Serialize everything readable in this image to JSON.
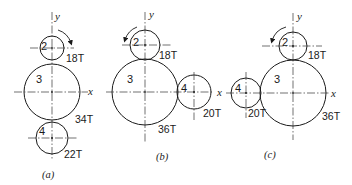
{
  "diagram": {
    "type": "gear-train-configurations",
    "axis_labels": {
      "x": "x",
      "y": "y"
    },
    "panels": [
      {
        "caption": "(a)",
        "rotation": "clockwise",
        "gears": [
          {
            "id": "2",
            "teeth": "18T"
          },
          {
            "id": "3",
            "teeth": "34T"
          },
          {
            "id": "4",
            "teeth": "22T"
          }
        ]
      },
      {
        "caption": "(b)",
        "rotation": "counterclockwise",
        "gears": [
          {
            "id": "2",
            "teeth": "18T"
          },
          {
            "id": "3",
            "teeth": "36T"
          },
          {
            "id": "4",
            "teeth": "20T"
          }
        ]
      },
      {
        "caption": "(c)",
        "rotation": "counterclockwise",
        "gears": [
          {
            "id": "2",
            "teeth": "18T"
          },
          {
            "id": "3",
            "teeth": "36T"
          },
          {
            "id": "4",
            "teeth": "20T"
          }
        ]
      }
    ]
  }
}
